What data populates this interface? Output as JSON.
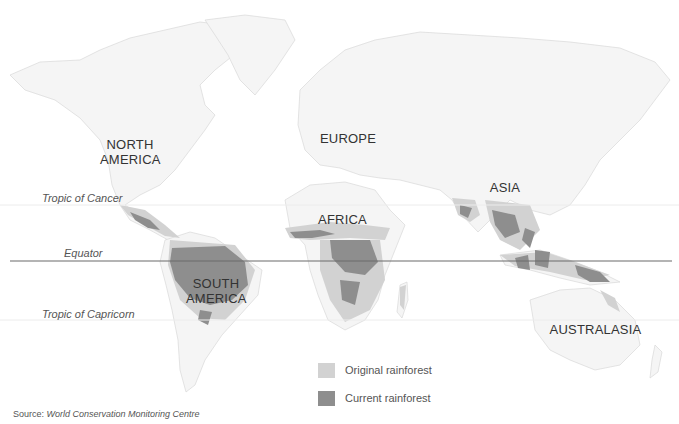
{
  "map": {
    "regions": [
      {
        "id": "north-america",
        "line1": "NORTH",
        "line2": "AMERICA"
      },
      {
        "id": "europe",
        "line1": "EUROPE",
        "line2": ""
      },
      {
        "id": "asia",
        "line1": "ASIA",
        "line2": ""
      },
      {
        "id": "africa",
        "line1": "AFRICA",
        "line2": ""
      },
      {
        "id": "south-america",
        "line1": "SOUTH",
        "line2": "AMERICA"
      },
      {
        "id": "australasia",
        "line1": "AUSTRALASIA",
        "line2": ""
      }
    ],
    "lines": {
      "tropic_cancer": "Tropic of Cancer",
      "equator": "Equator",
      "tropic_capricorn": "Tropic of Capricorn"
    },
    "colors": {
      "land": "#f4f4f4",
      "outline": "#d8d8d8",
      "original_rainforest": "#d2d2d2",
      "current_rainforest": "#8e8e8e",
      "equator_line": "#6a6a6a",
      "tropic_line": "#ececec"
    }
  },
  "legend": {
    "items": [
      {
        "label": "Original rainforest",
        "color": "#d2d2d2"
      },
      {
        "label": "Current rainforest",
        "color": "#8e8e8e"
      }
    ]
  },
  "source": {
    "prefix": "Source:",
    "name": "World Conservation Monitoring Centre"
  }
}
